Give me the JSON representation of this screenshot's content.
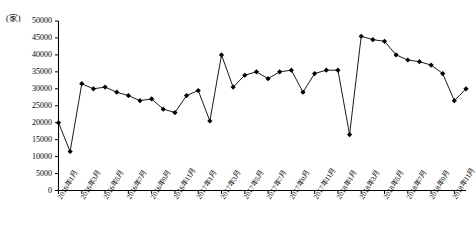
{
  "chart_data": {
    "type": "line",
    "title": "",
    "subtitle": "",
    "xlabel": "",
    "ylabel": "",
    "unit_label": "(家)",
    "ylim": [
      0,
      50000
    ],
    "ytick_step": 5000,
    "yticks": [
      0,
      5000,
      10000,
      15000,
      20000,
      25000,
      30000,
      35000,
      40000,
      45000,
      50000
    ],
    "ytick_labels": [
      "0",
      "5000",
      "10000",
      "15000",
      "20000",
      "25000",
      "30000",
      "35000",
      "40000",
      "45000",
      "50000"
    ],
    "grid": false,
    "legend": "none",
    "marker": "diamond",
    "line_color": "#000000",
    "marker_color": "#000000",
    "axis_color": "#000000",
    "x": [
      "2016年1月",
      "2016年2月",
      "2016年3月",
      "2016年4月",
      "2016年5月",
      "2016年6月",
      "2016年7月",
      "2016年8月",
      "2016年9月",
      "2016年10月",
      "2016年11月",
      "2016年12月",
      "2017年1月",
      "2017年2月",
      "2017年3月",
      "2017年4月",
      "2017年5月",
      "2017年6月",
      "2017年7月",
      "2017年8月",
      "2017年9月",
      "2017年10月",
      "2017年11月",
      "2017年12月",
      "2018年1月",
      "2018年2月",
      "2018年3月",
      "2018年4月",
      "2018年5月",
      "2018年6月",
      "2018年7月",
      "2018年8月",
      "2018年9月",
      "2018年10月",
      "2018年11月",
      "2018年12月"
    ],
    "xtick_labels_shown": [
      "2016年1月",
      "2016年3月",
      "2016年5月",
      "2016年7月",
      "2016年9月",
      "2016年11月",
      "2017年1月",
      "2017年3月",
      "2017年5月",
      "2017年7月",
      "2017年9月",
      "2017年11月",
      "2018年1月",
      "2018年3月",
      "2018年5月",
      "2018年7月",
      "2018年9月",
      "2018年11月"
    ],
    "values": [
      20000,
      11500,
      31500,
      30000,
      30500,
      29000,
      28000,
      26500,
      27000,
      24000,
      23000,
      28000,
      29500,
      20500,
      40000,
      30500,
      34000,
      35000,
      33000,
      35000,
      35500,
      29000,
      34500,
      35500,
      35500,
      16500,
      45500,
      44500,
      44000,
      40000,
      38500,
      38000,
      37000,
      34500,
      26500,
      30000
    ],
    "series": [
      {
        "name": "",
        "values": [
          20000,
          11500,
          31500,
          30000,
          30500,
          29000,
          28000,
          26500,
          27000,
          24000,
          23000,
          28000,
          29500,
          20500,
          40000,
          30500,
          34000,
          35000,
          33000,
          35000,
          35500,
          29000,
          34500,
          35500,
          35500,
          16500,
          45500,
          44500,
          44000,
          40000,
          38500,
          38000,
          37000,
          34500,
          26500,
          30000
        ]
      }
    ]
  }
}
